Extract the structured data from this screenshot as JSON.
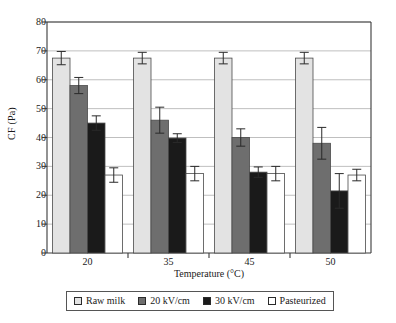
{
  "chart_data": {
    "type": "bar",
    "title": "",
    "subtitle": "",
    "xlabel": "Temperature (°C)",
    "ylabel": "CF (Pa)",
    "categories": [
      "20",
      "35",
      "45",
      "50"
    ],
    "ylim": [
      0,
      80
    ],
    "yticks": [
      0,
      10,
      20,
      30,
      40,
      50,
      60,
      70,
      80
    ],
    "grid": "horizontal",
    "legend_position": "bottom",
    "series": [
      {
        "name": "Raw milk",
        "color": "#e3e3e3",
        "values": [
          67.5,
          67.5,
          67.5,
          67.5
        ],
        "errors": [
          2.3,
          2.0,
          2.0,
          2.0
        ]
      },
      {
        "name": "20 kV/cm",
        "color": "#6e6e6e",
        "values": [
          58.0,
          46.0,
          40.0,
          38.0
        ],
        "errors": [
          2.8,
          4.5,
          3.0,
          5.5
        ]
      },
      {
        "name": "30 kV/cm",
        "color": "#1a1a1a",
        "values": [
          45.0,
          39.8,
          28.0,
          21.5
        ],
        "errors": [
          2.5,
          1.5,
          1.8,
          6.0
        ]
      },
      {
        "name": "Pasteurized",
        "color": "#ffffff",
        "values": [
          27.0,
          27.5,
          27.5,
          27.0
        ],
        "errors": [
          2.5,
          2.5,
          2.5,
          2.0
        ]
      }
    ]
  },
  "axes": {
    "y_tick_labels": [
      "80",
      "70",
      "60",
      "50",
      "40",
      "30",
      "20",
      "10",
      "0"
    ],
    "x_tick_labels": [
      "20",
      "35",
      "45",
      "50"
    ]
  },
  "legend": {
    "items": [
      {
        "label": "Raw milk",
        "color": "#e3e3e3"
      },
      {
        "label": "20 kV/cm",
        "color": "#6e6e6e"
      },
      {
        "label": "30 kV/cm",
        "color": "#1a1a1a"
      },
      {
        "label": "Pasteurized",
        "color": "#ffffff"
      }
    ]
  },
  "colors": {
    "axis": "#3a3a3a",
    "grid": "#b8b8b8",
    "bar_edge": "#4a4a4a",
    "error_bar": "#2a2a2a",
    "background": "#ffffff"
  }
}
